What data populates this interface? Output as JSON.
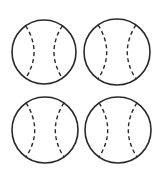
{
  "figure": {
    "stroke_color": "#2a2a2a",
    "background": "#ffffff",
    "balls": [
      {
        "id": "ball-top-left",
        "cx": 44,
        "cy": 52,
        "r": 32
      },
      {
        "id": "ball-top-right",
        "cx": 117,
        "cy": 52,
        "r": 33
      },
      {
        "id": "ball-bottom-left",
        "cx": 45,
        "cy": 130,
        "r": 33
      },
      {
        "id": "ball-bottom-right",
        "cx": 118,
        "cy": 130,
        "r": 33
      }
    ]
  }
}
